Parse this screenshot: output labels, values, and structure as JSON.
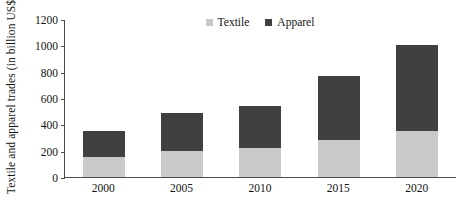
{
  "chart_data": {
    "type": "bar",
    "subtype": "stacked-column",
    "title": "",
    "xlabel": "",
    "ylabel": "Textile and apparel trades (in billion US$)",
    "categories": [
      "2000",
      "2005",
      "2010",
      "2015",
      "2020"
    ],
    "ylim": [
      0,
      1200
    ],
    "yticks": [
      0,
      200,
      400,
      600,
      800,
      1000,
      1200
    ],
    "ytick_labels": [
      "0",
      "200",
      "400",
      "600",
      "800",
      "1000",
      "1200"
    ],
    "grid": false,
    "legend_position": "top-center",
    "series": [
      {
        "name": "Textile",
        "color": "#c9c9c9",
        "values": [
          150,
          200,
          220,
          280,
          350
        ]
      },
      {
        "name": "Apparel",
        "color": "#404040",
        "values": [
          200,
          290,
          320,
          490,
          650
        ]
      }
    ],
    "totals": [
      350,
      490,
      540,
      770,
      1000
    ]
  },
  "legend": {
    "items": [
      {
        "label": "Textile",
        "color": "#c9c9c9"
      },
      {
        "label": "Apparel",
        "color": "#404040"
      }
    ]
  },
  "axis": {
    "y_title": "Textile and apparel trades (in billion US$)",
    "axis_color": "#4d4d4d"
  }
}
